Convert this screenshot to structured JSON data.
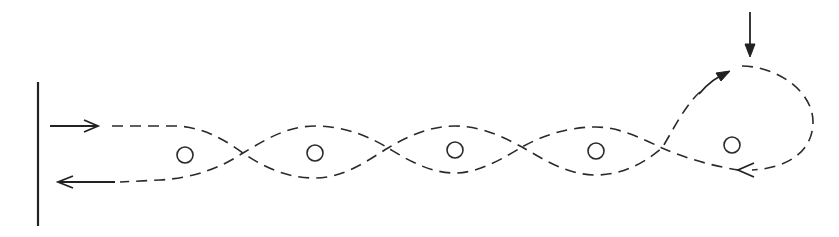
{
  "diagram": {
    "colors": {
      "background": "#ffffff",
      "stroke": "#2a2a2a"
    },
    "wall": {
      "x": 38,
      "y1": 82,
      "y2": 226
    },
    "incoming_arrow": {
      "x1": 50,
      "x2": 98,
      "y": 126,
      "direction": "right"
    },
    "outgoing_arrow": {
      "x1": 115,
      "x2": 58,
      "y": 182,
      "direction": "left"
    },
    "top_arrow": {
      "x": 750,
      "y1": 12,
      "y2": 56,
      "direction": "down"
    },
    "scatterers": [
      {
        "id": 1,
        "cx": 185,
        "cy": 155,
        "r": 8
      },
      {
        "id": 2,
        "cx": 315,
        "cy": 153,
        "r": 8
      },
      {
        "id": 3,
        "cx": 455,
        "cy": 150,
        "r": 8
      },
      {
        "id": 4,
        "cx": 596,
        "cy": 151,
        "r": 8
      },
      {
        "id": 5,
        "cx": 732,
        "cy": 145,
        "r": 8
      }
    ],
    "crossings": [
      {
        "x": 243,
        "y": 153
      },
      {
        "x": 388,
        "y": 148
      },
      {
        "x": 522,
        "y": 147
      },
      {
        "x": 662,
        "y": 148
      }
    ],
    "loop_arrows": [
      {
        "position": "upper-left of loop",
        "tip_x": 730,
        "tip_y": 72,
        "direction": "up-right"
      },
      {
        "position": "bottom of loop",
        "tip_x": 738,
        "tip_y": 170,
        "direction": "left"
      }
    ]
  }
}
